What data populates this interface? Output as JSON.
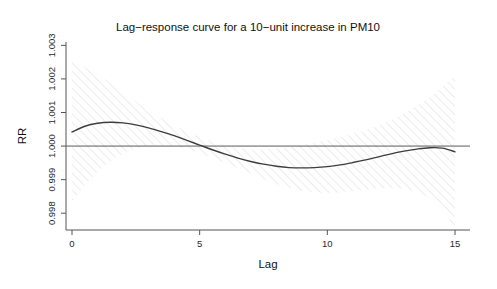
{
  "chart_data": {
    "type": "line",
    "title": "Lag−response curve for a 10−unit increase in PM10",
    "xlabel": "Lag",
    "ylabel": "RR",
    "xlim": [
      0,
      15
    ],
    "ylim": [
      0.9975,
      1.0031
    ],
    "grid": false,
    "legend": null,
    "xticks": [
      0,
      5,
      10,
      15
    ],
    "xtick_labels": [
      "0",
      "5",
      "10",
      "15"
    ],
    "yticks": [
      0.998,
      0.999,
      1.0,
      1.001,
      1.002,
      1.003
    ],
    "ytick_labels": [
      "0.998",
      "0.999",
      "1.000",
      "1.001",
      "1.002",
      "1.003"
    ],
    "reference_line": {
      "orientation": "horizontal",
      "value": 1.0,
      "label": "null RR = 1"
    },
    "x": [
      0,
      0.5,
      1,
      1.5,
      2,
      2.5,
      3,
      3.5,
      4,
      4.5,
      5,
      5.5,
      6,
      6.5,
      7,
      7.5,
      8,
      8.5,
      9,
      9.5,
      10,
      10.5,
      11,
      11.5,
      12,
      12.5,
      13,
      13.5,
      14,
      14.5,
      15
    ],
    "series": [
      {
        "name": "fit",
        "style": "solid-line",
        "color": "#3d3d3d",
        "values": [
          1.00042,
          1.00059,
          1.00068,
          1.00071,
          1.00069,
          1.00063,
          1.00054,
          1.00043,
          1.00031,
          1.00017,
          1.00003,
          0.99989,
          0.99976,
          0.99964,
          0.99954,
          0.99946,
          0.9994,
          0.99936,
          0.99935,
          0.99936,
          0.99939,
          0.99944,
          0.99951,
          0.99959,
          0.99968,
          0.99977,
          0.99985,
          0.99991,
          0.99995,
          0.99994,
          0.99983
        ]
      },
      {
        "name": "upper-95-ci",
        "style": "hatched-band-edge",
        "color": "#c9c9c9",
        "values": [
          1.00252,
          1.00235,
          1.00213,
          1.00188,
          1.0016,
          1.00133,
          1.00107,
          1.00083,
          1.00062,
          1.00043,
          1.00027,
          1.00013,
          1.00002,
          0.99994,
          0.9999,
          0.9999,
          0.99992,
          0.99997,
          1.00003,
          1.0001,
          1.00017,
          1.00026,
          1.00036,
          1.00048,
          1.00062,
          1.00078,
          1.00097,
          1.00119,
          1.00145,
          1.00176,
          1.00212
        ]
      },
      {
        "name": "lower-95-ci",
        "style": "hatched-band-edge",
        "color": "#c9c9c9",
        "values": [
          0.99832,
          0.99883,
          0.99923,
          0.99954,
          0.99978,
          0.99993,
          1.00001,
          1.00003,
          1.0,
          0.99991,
          0.99979,
          0.99965,
          0.9995,
          0.99934,
          0.99918,
          0.99902,
          0.99888,
          0.99875,
          0.99867,
          0.99862,
          0.99861,
          0.99862,
          0.99866,
          0.9987,
          0.99874,
          0.99876,
          0.99873,
          0.99863,
          0.99845,
          0.99812,
          0.99754
        ]
      }
    ],
    "band_description": "95% confidence interval shown as light grey diagonal hatching"
  },
  "figure": {
    "title": "Lag−response curve for a 10−unit increase in PM10",
    "x_axis_title": "Lag",
    "y_axis_title": "RR"
  }
}
